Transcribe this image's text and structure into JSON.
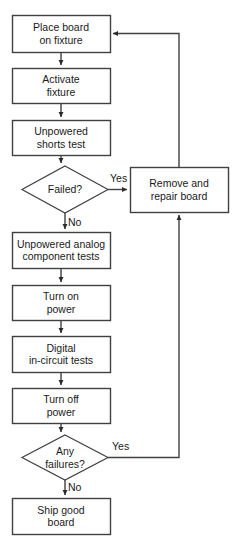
{
  "diagram": {
    "type": "flowchart",
    "stroke_color": "#404040",
    "fill_color": "#ffffff",
    "text_color": "#1a1a1a",
    "nodes": [
      {
        "id": "place_board",
        "shape": "process",
        "label": "Place board\non fixture",
        "x": 12,
        "y": 15,
        "w": 98,
        "h": 37
      },
      {
        "id": "activate_fixture",
        "shape": "process",
        "label": "Activate\nfixture",
        "x": 12,
        "y": 68,
        "w": 98,
        "h": 35
      },
      {
        "id": "shorts_test",
        "shape": "process",
        "label": "Unpowered\nshorts test",
        "x": 12,
        "y": 120,
        "w": 98,
        "h": 35
      },
      {
        "id": "failed_decision",
        "shape": "decision",
        "label": "Failed?",
        "x": 22,
        "y": 166,
        "w": 86,
        "h": 47
      },
      {
        "id": "remove_repair",
        "shape": "process",
        "label": "Remove and\nrepair board",
        "x": 130,
        "y": 167,
        "w": 98,
        "h": 45
      },
      {
        "id": "analog_tests",
        "shape": "process",
        "label": "Unpowered analog\ncomponent tests",
        "x": 12,
        "y": 232,
        "w": 98,
        "h": 36
      },
      {
        "id": "turn_on_power",
        "shape": "process",
        "label": "Turn on\npower",
        "x": 12,
        "y": 285,
        "w": 98,
        "h": 35
      },
      {
        "id": "digital_tests",
        "shape": "process",
        "label": "Digital\nin-circuit tests",
        "x": 12,
        "y": 336,
        "w": 98,
        "h": 36
      },
      {
        "id": "turn_off_power",
        "shape": "process",
        "label": "Turn off\npower",
        "x": 12,
        "y": 388,
        "w": 98,
        "h": 35
      },
      {
        "id": "any_failures",
        "shape": "decision",
        "label": "Any\nfailures?",
        "x": 22,
        "y": 435,
        "w": 86,
        "h": 45
      },
      {
        "id": "ship_board",
        "shape": "process",
        "label": "Ship good\nboard",
        "x": 12,
        "y": 498,
        "w": 98,
        "h": 36
      }
    ],
    "edges": [
      {
        "id": "e_place_activate",
        "from": "place_board",
        "to": "activate_fixture",
        "label": ""
      },
      {
        "id": "e_activate_shorts",
        "from": "activate_fixture",
        "to": "shorts_test",
        "label": ""
      },
      {
        "id": "e_shorts_failed",
        "from": "shorts_test",
        "to": "failed_decision",
        "label": ""
      },
      {
        "id": "e_failed_yes",
        "from": "failed_decision",
        "to": "remove_repair",
        "label": "Yes",
        "label_x": 110,
        "label_y": 172
      },
      {
        "id": "e_failed_no",
        "from": "failed_decision",
        "to": "analog_tests",
        "label": "No",
        "label_x": 68,
        "label_y": 216
      },
      {
        "id": "e_analog_poweron",
        "from": "analog_tests",
        "to": "turn_on_power",
        "label": ""
      },
      {
        "id": "e_poweron_digital",
        "from": "turn_on_power",
        "to": "digital_tests",
        "label": ""
      },
      {
        "id": "e_digital_poweroff",
        "from": "digital_tests",
        "to": "turn_off_power",
        "label": ""
      },
      {
        "id": "e_poweroff_anyfail",
        "from": "turn_off_power",
        "to": "any_failures",
        "label": ""
      },
      {
        "id": "e_anyfail_yes",
        "from": "any_failures",
        "to": "remove_repair",
        "label": "Yes",
        "label_x": 112,
        "label_y": 440
      },
      {
        "id": "e_anyfail_no",
        "from": "any_failures",
        "to": "ship_board",
        "label": "No",
        "label_x": 68,
        "label_y": 481
      },
      {
        "id": "e_repair_place",
        "from": "remove_repair",
        "to": "place_board",
        "label": ""
      }
    ]
  }
}
